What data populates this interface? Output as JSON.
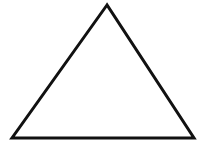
{
  "diagram": {
    "shape": "triangle",
    "vertices": {
      "apex": [
        107,
        5
      ],
      "bottom_left": [
        12,
        138
      ],
      "bottom_right": [
        194,
        138
      ]
    },
    "stroke_color": "#111111",
    "fill_color": "#ffffff",
    "stroke_width": 3
  }
}
